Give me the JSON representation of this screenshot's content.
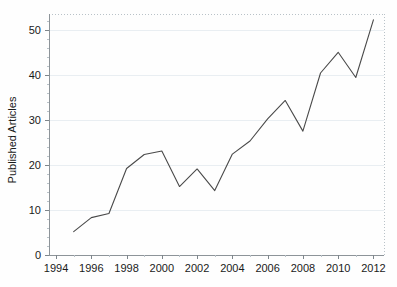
{
  "chart_data": {
    "type": "line",
    "title": "",
    "subtitle": "",
    "xlabel": "",
    "ylabel": "Published Articles",
    "x": [
      1995,
      1996,
      1997,
      1998,
      1999,
      2000,
      2001,
      2002,
      2003,
      2004,
      2005,
      2006,
      2007,
      2008,
      2009,
      2010,
      2011,
      2012
    ],
    "values": [
      5.2,
      8.3,
      9.2,
      19.2,
      22.3,
      23.1,
      15.2,
      19.1,
      14.3,
      22.4,
      25.3,
      30.2,
      34.3,
      27.5,
      40.4,
      45.0,
      39.4,
      52.2
    ],
    "series": [
      {
        "name": "Published Articles",
        "values": [
          5.2,
          8.3,
          9.2,
          19.2,
          22.3,
          23.1,
          15.2,
          19.1,
          14.3,
          22.4,
          25.3,
          30.2,
          34.3,
          27.5,
          40.4,
          45.0,
          39.4,
          52.2
        ],
        "color": "#4a4a4a"
      }
    ],
    "xlim": [
      1993.6,
      2012.6
    ],
    "ylim": [
      0,
      53.5
    ],
    "xticks": [
      1994,
      1996,
      1998,
      2000,
      2002,
      2004,
      2006,
      2008,
      2010,
      2012
    ],
    "xtick_labels": [
      "1994",
      "1996",
      "1998",
      "2000",
      "2002",
      "2004",
      "2006",
      "2008",
      "2010",
      "2012"
    ],
    "yticks": [
      0,
      10,
      20,
      30,
      40,
      50
    ],
    "ytick_labels": [
      "0",
      "10",
      "20",
      "30",
      "40",
      "50"
    ],
    "grid": true,
    "grid_axis": "y",
    "legend": false,
    "legend_position": "none",
    "annotations": [],
    "colors": {
      "line": "#4a4a4a",
      "grid": "#e9eef2",
      "axis": "#8d9499",
      "text": "#1a1a1a",
      "background": "#fefefe"
    }
  }
}
